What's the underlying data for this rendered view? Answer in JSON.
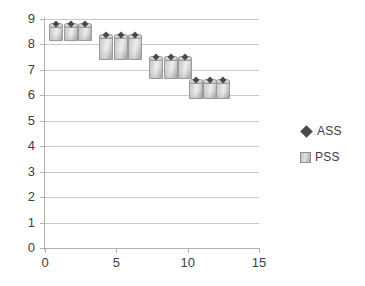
{
  "chart_data": {
    "type": "bar",
    "title": "",
    "subtitle": "",
    "xlabel": "",
    "ylabel": "",
    "xlim": [
      0,
      15
    ],
    "ylim": [
      0,
      9
    ],
    "x_ticks": [
      0,
      5,
      10,
      15
    ],
    "y_ticks": [
      0,
      1,
      2,
      3,
      4,
      5,
      6,
      7,
      8,
      9
    ],
    "grid": "horizontal",
    "legend_position": "right",
    "legend": [
      {
        "name": "ASS",
        "marker": "diamond",
        "color": "#4a4a4a"
      },
      {
        "name": "PSS",
        "marker": "bar",
        "color": "#c9c9c9"
      }
    ],
    "x": [
      0.8,
      1.8,
      2.8,
      4.3,
      5.3,
      6.3,
      7.8,
      8.8,
      9.8,
      10.6,
      11.6,
      12.5
    ],
    "series": [
      {
        "name": "ASS",
        "note": "diamond markers sitting at the top of each floating bar",
        "values": [
          8.78,
          8.78,
          8.78,
          8.35,
          8.35,
          8.35,
          7.45,
          7.45,
          7.45,
          6.57,
          6.57,
          6.57
        ]
      },
      {
        "name": "PSS",
        "note": "floating bars: each bar spans from its low value to its high value",
        "low": [
          8.12,
          8.12,
          8.12,
          7.4,
          7.4,
          7.4,
          6.66,
          6.66,
          6.66,
          5.86,
          5.86,
          5.86
        ],
        "high": [
          8.78,
          8.78,
          8.78,
          8.35,
          8.35,
          8.35,
          7.45,
          7.45,
          7.45,
          6.57,
          6.57,
          6.57
        ]
      }
    ],
    "y_tick_labels": [
      "0",
      "1",
      "2",
      "3",
      "4",
      "5",
      "6",
      "7",
      "8",
      "9"
    ],
    "x_tick_labels": [
      "0",
      "5",
      "10",
      "15"
    ]
  }
}
